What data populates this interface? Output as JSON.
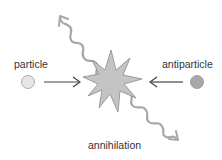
{
  "diagram": {
    "type": "particle-antiparticle annihilation",
    "labels": {
      "particle": "particle",
      "antiparticle": "antiparticle",
      "event": "annihilation"
    },
    "colors": {
      "particle_fill": "#e6e6e6",
      "particle_stroke": "#9a9a9a",
      "antiparticle_fill": "#a8a8a8",
      "antiparticle_stroke": "#909090",
      "burst_fill": "#c4c4c4",
      "burst_stroke": "#8a8a8a",
      "arrow": "#444444",
      "photon": "#a8a8a8",
      "text": "#333333"
    },
    "elements": [
      {
        "name": "particle",
        "shape": "circle",
        "description": "light grey circle moving right"
      },
      {
        "name": "antiparticle",
        "shape": "circle",
        "description": "dark grey circle moving left"
      },
      {
        "name": "annihilation-burst",
        "shape": "starburst",
        "description": "collision point"
      },
      {
        "name": "photon-1",
        "shape": "wavy-arrow",
        "direction": "up-left"
      },
      {
        "name": "photon-2",
        "shape": "wavy-arrow",
        "direction": "down-right"
      }
    ]
  }
}
